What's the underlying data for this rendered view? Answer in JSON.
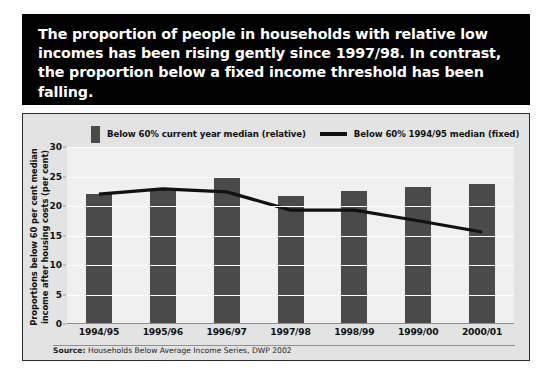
{
  "headline": {
    "text": "The proportion of people in households with relative low incomes has been rising gently since 1997/98. In contrast, the proportion below a fixed income threshold has been falling."
  },
  "legend": {
    "bar_label": "Below 60% current year median (relative)",
    "line_label": "Below 60% 1994/95 median (fixed)"
  },
  "axis": {
    "y_title_line1": "Proportions below 60 per cent median",
    "y_title_line2": "income after housing costs (per cent)"
  },
  "source": {
    "prefix": "Source:",
    "text": "Households Below Average Income Series, DWP 2002"
  },
  "colors": {
    "banner_background": "#000000",
    "banner_text": "#ffffff",
    "panel_background": "#e3e3e3",
    "plot_background": "#f0f0f0",
    "bar": "#4a4a4a",
    "line": "#111111",
    "gridline": "#fdfdfd"
  },
  "chart_data": {
    "type": "bar",
    "title": "",
    "xlabel": "",
    "ylabel": "Proportions below 60 per cent median income after housing costs (per cent)",
    "categories": [
      "1994/95",
      "1995/96",
      "1996/97",
      "1997/98",
      "1998/99",
      "1999/00",
      "2000/01"
    ],
    "ylim": [
      0,
      30
    ],
    "yticks": [
      0,
      5,
      10,
      15,
      20,
      25,
      30
    ],
    "grid": true,
    "legend_position": "top",
    "series": [
      {
        "name": "Below 60% current year median (relative)",
        "type": "bar",
        "color": "#4a4a4a",
        "values": [
          22.0,
          22.8,
          24.7,
          21.7,
          22.6,
          23.2,
          23.8
        ]
      },
      {
        "name": "Below 60% 1994/95 median (fixed)",
        "type": "line",
        "color": "#111111",
        "values": [
          22.0,
          22.9,
          22.4,
          19.3,
          19.3,
          17.5,
          15.6
        ]
      }
    ]
  }
}
